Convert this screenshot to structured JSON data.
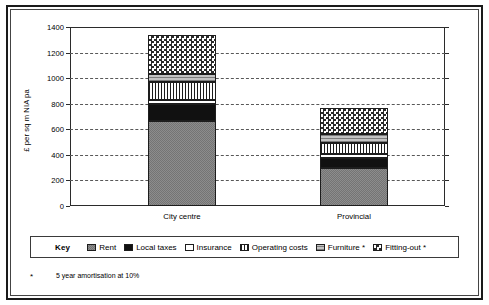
{
  "chart_data": {
    "type": "bar",
    "subtype": "stacked",
    "title": "",
    "xlabel": "",
    "ylabel": "£ per sq m NIA pa",
    "categories": [
      "City centre",
      "Provincial"
    ],
    "ylim": [
      0,
      1400
    ],
    "ytick_step": 200,
    "yticks": [
      "0",
      "200",
      "400",
      "600",
      "800",
      "1000",
      "1200",
      "1400"
    ],
    "grid": "horizontal-dashed",
    "legend_position": "bottom",
    "series": [
      {
        "name": "Rent",
        "pattern": "diagonal-crosshatch-grey",
        "values": [
          665,
          295
        ]
      },
      {
        "name": "Local taxes",
        "pattern": "solid-black",
        "values": [
          134,
          79
        ]
      },
      {
        "name": "Insurance",
        "pattern": "solid-white",
        "values": [
          31,
          31
        ]
      },
      {
        "name": "Operating costs",
        "pattern": "vertical-lines",
        "values": [
          142,
          87
        ]
      },
      {
        "name": "Furniture *",
        "pattern": "horizontal-lines-grey",
        "values": [
          63,
          71
        ]
      },
      {
        "name": "Fitting-out *",
        "pattern": "checkerboard",
        "values": [
          299,
          205
        ]
      }
    ],
    "totals": [
      1334,
      768
    ],
    "annotations": [
      "5 year amortisation at 10%"
    ]
  },
  "legend": {
    "key_label": "Key",
    "items": [
      {
        "label": "Rent"
      },
      {
        "label": "Local taxes"
      },
      {
        "label": "Insurance"
      },
      {
        "label": "Operating costs"
      },
      {
        "label": "Furniture *"
      },
      {
        "label": "Fitting-out *"
      }
    ]
  },
  "footnote": {
    "marker": "*",
    "text": "5 year amortisation at 10%"
  },
  "colors": {
    "axis": "#2b2b2b",
    "grid": "#585858",
    "frame": "#1a1a1a",
    "black_fill": "#111111",
    "grey_fill": "#b9b9b9",
    "background": "#ffffff"
  }
}
